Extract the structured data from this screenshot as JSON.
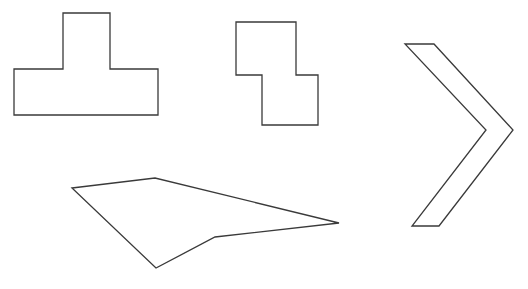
{
  "diagram": {
    "width": 528,
    "height": 289,
    "background": "#ffffff",
    "stroke_color": "#3a3a3a",
    "shapes": [
      {
        "name": "t-shape",
        "points": [
          [
            63,
            13
          ],
          [
            110,
            13
          ],
          [
            110,
            69
          ],
          [
            158,
            69
          ],
          [
            158,
            115
          ],
          [
            14,
            115
          ],
          [
            14,
            69
          ],
          [
            63,
            69
          ]
        ]
      },
      {
        "name": "s-shape",
        "points": [
          [
            236,
            22
          ],
          [
            296,
            22
          ],
          [
            296,
            75
          ],
          [
            318,
            75
          ],
          [
            318,
            125
          ],
          [
            262,
            125
          ],
          [
            262,
            75
          ],
          [
            236,
            75
          ]
        ]
      },
      {
        "name": "chevron-shape",
        "points": [
          [
            405,
            44
          ],
          [
            434,
            44
          ],
          [
            513,
            130
          ],
          [
            439,
            226
          ],
          [
            412,
            226
          ],
          [
            486,
            130
          ]
        ]
      },
      {
        "name": "irregular-quadrilateral",
        "points": [
          [
            72,
            188
          ],
          [
            155,
            178
          ],
          [
            339,
            223
          ],
          [
            215,
            237
          ],
          [
            156,
            268
          ]
        ]
      }
    ]
  }
}
